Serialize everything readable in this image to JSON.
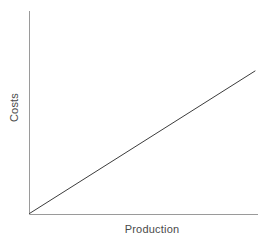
{
  "chart_data": {
    "type": "line",
    "title": "",
    "subtitle": "",
    "xlabel": "Production",
    "ylabel": "Costs",
    "x": [
      0,
      1
    ],
    "series": [
      {
        "name": "Total costs",
        "values": [
          0,
          1
        ]
      }
    ],
    "xlim": [
      0,
      1
    ],
    "ylim": [
      0,
      1
    ],
    "xticks": [],
    "yticks": [],
    "xticklabels": [],
    "yticklabels": [],
    "grid": false,
    "legend": false,
    "legend_position": "none",
    "annotations": []
  },
  "style": {
    "background_color": "#ffffff",
    "axis_color": "#9a9a9a",
    "line_color": "#3c3c3c",
    "label_color": "#4a4a4a",
    "line_width": 1,
    "axis_width": 1
  }
}
